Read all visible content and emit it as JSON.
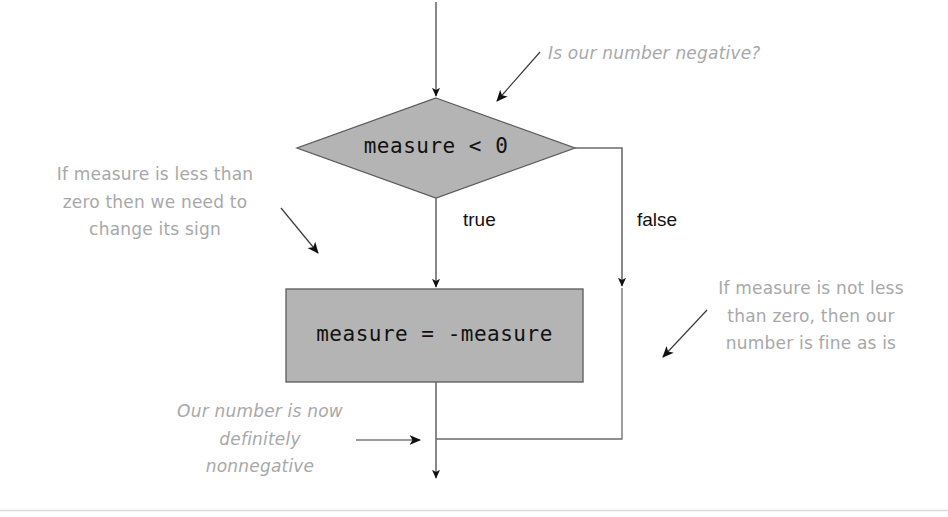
{
  "canvas": {
    "width": 948,
    "height": 517,
    "background": "#ffffff",
    "shape_fill": "#b4b4b4",
    "shape_stroke": "#555555",
    "line_color": "#555555",
    "annotation_color": "#a8a8a8",
    "text_color": "#111111",
    "rule_color": "#d9d9d9"
  },
  "diagram": {
    "type": "flowchart",
    "nodes": [
      {
        "id": "decision",
        "shape": "diamond",
        "text": "measure < 0",
        "cx": 436,
        "cy": 148,
        "half_width": 139,
        "half_height": 50
      },
      {
        "id": "process",
        "shape": "rectangle",
        "text": "measure = -measure",
        "x": 286,
        "y": 289,
        "width": 297,
        "height": 93
      }
    ],
    "edge_labels": [
      {
        "id": "true-branch",
        "text": "true",
        "x": 463,
        "y": 209
      },
      {
        "id": "false-branch",
        "text": "false",
        "x": 637,
        "y": 209
      }
    ]
  },
  "annotations": [
    {
      "id": "question",
      "text": "Is our number negative?",
      "style": "italic",
      "arrow": {
        "from": [
          540,
          52
        ],
        "to": [
          494,
          104
        ]
      }
    },
    {
      "id": "true-branch-note",
      "text": "If measure is less than\nzero then we need to\nchange its sign",
      "style": "upright",
      "arrow": {
        "from": [
          281,
          208
        ],
        "to": [
          321,
          256
        ]
      }
    },
    {
      "id": "false-branch-note",
      "text": "If measure is not less\nthan zero, then our\nnumber is fine as is",
      "style": "upright",
      "arrow": {
        "from": [
          707,
          310
        ],
        "to": [
          660,
          360
        ]
      }
    },
    {
      "id": "merge-note",
      "text": "Our number is now\ndefinitely\nnonnegative",
      "style": "italic",
      "arrow": {
        "from": [
          356,
          440
        ],
        "to": [
          424,
          440
        ]
      }
    }
  ]
}
